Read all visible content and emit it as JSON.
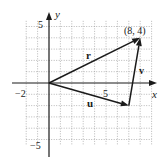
{
  "figure": {
    "axis_labels": {
      "x": "x",
      "y": "y"
    },
    "tick_labels": {
      "x_neg": "−2",
      "x_pos": "5",
      "y_pos": "5",
      "y_neg": "−5"
    },
    "point_label": "(8, 4)",
    "vectors": [
      {
        "name": "r",
        "label": "r",
        "from": [
          0,
          0
        ],
        "to": [
          8,
          4
        ]
      },
      {
        "name": "u",
        "label": "u",
        "from": [
          0,
          0
        ],
        "to": [
          7,
          -2
        ]
      },
      {
        "name": "v",
        "label": "v",
        "from": [
          7,
          -2
        ],
        "to": [
          8,
          4
        ]
      }
    ],
    "grid": {
      "x_range": [
        -2,
        9
      ],
      "y_range": [
        -5,
        5
      ],
      "step": 1,
      "style": "dotted"
    },
    "colors": {
      "ink": "#1a1a1a",
      "grid": "#9a9a9a"
    }
  }
}
